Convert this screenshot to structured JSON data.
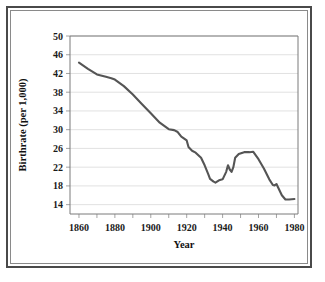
{
  "chart_data": {
    "type": "line",
    "title": "",
    "xlabel": "Year",
    "ylabel": "Birthrate (per 1,000)",
    "xlim": [
      1855,
      1982
    ],
    "ylim": [
      12,
      50
    ],
    "grid": true,
    "legend": false,
    "line_color": "#555555",
    "xticks": [
      1860,
      1880,
      1900,
      1920,
      1940,
      1960,
      1980
    ],
    "xtick_labels": [
      "1860",
      "1880",
      "1900",
      "1920",
      "1940",
      "1960",
      "1980"
    ],
    "xminor_step": 10,
    "yticks": [
      14,
      18,
      22,
      26,
      30,
      34,
      38,
      42,
      46,
      50
    ],
    "ytick_labels": [
      "14",
      "18",
      "22",
      "26",
      "30",
      "34",
      "38",
      "42",
      "46",
      "50"
    ],
    "series": [
      {
        "name": "Birthrate",
        "x": [
          1860,
          1865,
          1870,
          1875,
          1878,
          1880,
          1885,
          1890,
          1895,
          1900,
          1905,
          1910,
          1913,
          1915,
          1917,
          1920,
          1921,
          1923,
          1925,
          1928,
          1930,
          1932,
          1933,
          1935,
          1936,
          1938,
          1940,
          1942,
          1943,
          1944,
          1945,
          1946,
          1947,
          1949,
          1952,
          1955,
          1957,
          1960,
          1963,
          1966,
          1968,
          1969,
          1970,
          1971,
          1973,
          1975,
          1977,
          1980
        ],
        "y": [
          44.3,
          43.0,
          41.8,
          41.3,
          41.0,
          40.7,
          39.3,
          37.5,
          35.5,
          33.5,
          31.5,
          30.1,
          29.9,
          29.5,
          28.5,
          27.7,
          26.3,
          25.5,
          25.1,
          24.0,
          22.4,
          20.5,
          19.5,
          18.9,
          18.7,
          19.2,
          19.4,
          21.0,
          22.4,
          21.5,
          21.0,
          22.0,
          24.0,
          24.8,
          25.2,
          25.2,
          25.3,
          23.7,
          21.7,
          19.4,
          18.2,
          18.1,
          18.4,
          17.6,
          16.0,
          15.1,
          15.1,
          15.2
        ]
      }
    ]
  }
}
